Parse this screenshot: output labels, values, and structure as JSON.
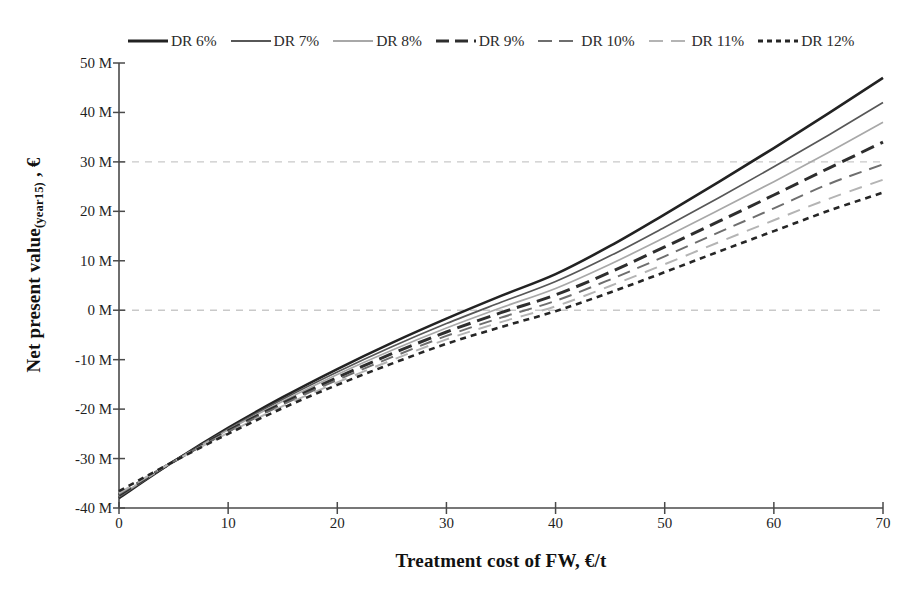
{
  "chart_data": {
    "type": "line",
    "title": "",
    "xlabel": "Treatment cost of FW, €/t",
    "ylabel": "Net present value (year15) , €",
    "ylabel_main": "Net present value",
    "ylabel_sub": "(year15)",
    "ylabel_tail": " , €",
    "xlim": [
      0,
      70
    ],
    "ylim": [
      -40,
      50
    ],
    "yunit": "M",
    "grid": true,
    "gridlines": [
      30,
      0
    ],
    "legend_position": "top",
    "xticks": [
      0,
      10,
      20,
      30,
      40,
      50,
      60,
      70
    ],
    "xtick_labels": [
      "0",
      "10",
      "20",
      "30",
      "40",
      "50",
      "60",
      "70"
    ],
    "yticks": [
      50,
      40,
      30,
      20,
      10,
      0,
      -10,
      -20,
      -30,
      -40
    ],
    "ytick_labels": [
      "50 M",
      "40 M",
      "30 M",
      "20 M",
      "10 M",
      "0 M",
      "-10 M",
      "-20 M",
      "-30 M",
      "-40 M"
    ],
    "x": [
      0,
      5,
      10,
      15,
      20,
      25,
      30,
      35,
      40,
      45,
      50,
      55,
      60,
      65,
      70
    ],
    "series": [
      {
        "name": "DR 6%",
        "color": "#222222",
        "width": 2.6,
        "dash": "none",
        "values": [
          -38.0,
          -30.6,
          -23.8,
          -17.6,
          -11.9,
          -6.6,
          -1.7,
          2.9,
          7.3,
          13.0,
          19.4,
          26.0,
          32.8,
          39.8,
          47.0
        ]
      },
      {
        "name": "DR 7%",
        "color": "#575757",
        "width": 1.7,
        "dash": "none",
        "values": [
          -37.8,
          -30.6,
          -24.0,
          -18.0,
          -12.5,
          -7.4,
          -2.7,
          1.6,
          5.8,
          11.0,
          16.8,
          22.8,
          29.0,
          35.4,
          42.0
        ]
      },
      {
        "name": "DR 8%",
        "color": "#a8a8a8",
        "width": 1.7,
        "dash": "none",
        "values": [
          -37.6,
          -30.6,
          -24.2,
          -18.4,
          -13.0,
          -8.1,
          -3.6,
          0.5,
          4.4,
          9.3,
          14.7,
          20.3,
          26.0,
          31.9,
          38.0
        ]
      },
      {
        "name": "DR 9%",
        "color": "#2e2e2e",
        "width": 3.0,
        "dash": "14,7",
        "values": [
          -37.4,
          -30.6,
          -24.4,
          -18.8,
          -13.6,
          -8.8,
          -4.4,
          -0.5,
          3.1,
          7.7,
          12.8,
          18.0,
          23.3,
          28.7,
          34.0
        ]
      },
      {
        "name": "DR 10%",
        "color": "#6e6e6e",
        "width": 2.0,
        "dash": "13,8",
        "values": [
          -37.2,
          -30.6,
          -24.6,
          -19.1,
          -14.1,
          -9.5,
          -5.2,
          -1.5,
          1.9,
          6.2,
          10.9,
          15.8,
          20.6,
          25.5,
          29.5
        ]
      },
      {
        "name": "DR 11%",
        "color": "#b4b4b4",
        "width": 2.0,
        "dash": "13,9",
        "values": [
          -37.0,
          -30.6,
          -24.8,
          -19.4,
          -14.6,
          -10.1,
          -5.9,
          -2.4,
          0.8,
          4.9,
          9.3,
          13.8,
          18.2,
          22.5,
          26.4
        ]
      },
      {
        "name": "DR 12%",
        "color": "#262626",
        "width": 2.6,
        "dash": "6,5",
        "values": [
          -36.6,
          -30.6,
          -25.0,
          -19.8,
          -15.1,
          -10.8,
          -6.8,
          -3.4,
          -0.2,
          3.6,
          7.7,
          11.9,
          16.0,
          20.1,
          23.8
        ]
      }
    ]
  },
  "axes": {
    "axis_color": "#4a4a4a",
    "grid_color": "#c9c9c9"
  }
}
